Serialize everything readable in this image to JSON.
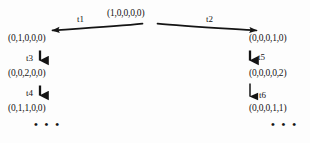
{
  "diagram": {
    "type": "reachability-tree",
    "title": "",
    "background_color": "#fdfdfd",
    "ink_color": "#141414",
    "root": {
      "id": "root",
      "marking": "(1,0,0,0,0)"
    },
    "left_branch": {
      "transition": "t1",
      "nodes": [
        {
          "id": "left-1",
          "marking": "(0,1,0,0,0)"
        },
        {
          "id": "left-2",
          "marking": "(0,0,2,0,0)"
        },
        {
          "id": "left-3",
          "marking": "(0,1,1,0,0)"
        }
      ],
      "transitions": [
        "t3",
        "t4"
      ],
      "continuation": "• • •"
    },
    "right_branch": {
      "transition": "t2",
      "nodes": [
        {
          "id": "right-1",
          "marking": "(0,0,0,1,0)"
        },
        {
          "id": "right-2",
          "marking": "(0,0,0,0,2)"
        },
        {
          "id": "right-3",
          "marking": "(0,0,0,1,1)"
        }
      ],
      "transitions": [
        "t5",
        "t6"
      ],
      "continuation": "• • •"
    },
    "edges": [
      {
        "id": "edge-t1",
        "label": "t1",
        "from": "root",
        "to": "left-1",
        "direction": "down-left"
      },
      {
        "id": "edge-t2",
        "label": "t2",
        "from": "root",
        "to": "right-1",
        "direction": "down-right"
      },
      {
        "id": "edge-t3",
        "label": "t3",
        "from": "left-1",
        "to": "left-2",
        "direction": "down"
      },
      {
        "id": "edge-t4",
        "label": "t4",
        "from": "left-2",
        "to": "left-3",
        "direction": "down"
      },
      {
        "id": "edge-t5",
        "label": "t5",
        "from": "right-1",
        "to": "right-2",
        "direction": "down"
      },
      {
        "id": "edge-t6",
        "label": "t6",
        "from": "right-2",
        "to": "right-3",
        "direction": "down"
      }
    ]
  }
}
